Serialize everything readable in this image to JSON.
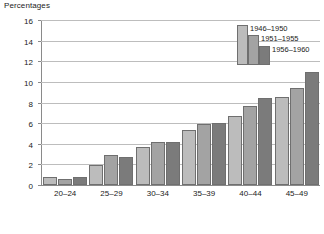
{
  "chart_data": {
    "type": "bar",
    "title": "Percentages",
    "xlabel": "",
    "ylabel": "",
    "ylim": [
      0,
      16
    ],
    "ytick_step": 2,
    "yticks": [
      0,
      2,
      4,
      6,
      8,
      10,
      12,
      14,
      16
    ],
    "grid": true,
    "legend_position": "upper-right-inside",
    "categories": [
      "20–24",
      "25–29",
      "30–34",
      "35–39",
      "40–44",
      "45–49"
    ],
    "series": [
      {
        "name": "1946–1950",
        "color": "#bcbcbc",
        "values": [
          0.8,
          1.9,
          3.7,
          5.3,
          6.7,
          8.5
        ]
      },
      {
        "name": "1951–1955",
        "color": "#a3a3a3",
        "values": [
          0.6,
          2.9,
          4.2,
          5.9,
          7.7,
          9.4
        ]
      },
      {
        "name": "1956–1960",
        "color": "#7b7b7b",
        "values": [
          0.8,
          2.7,
          4.15,
          6.0,
          8.4,
          11.0
        ]
      }
    ]
  },
  "axis": {
    "y_tick_labels": [
      "16",
      "14",
      "12",
      "10",
      "8",
      "6",
      "4",
      "2",
      "0"
    ]
  }
}
